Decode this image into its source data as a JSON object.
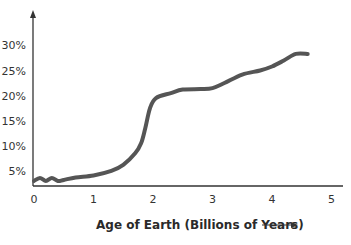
{
  "chart_data": {
    "type": "line",
    "title": "",
    "xlabel": "Age of Earth (Billions of Years)",
    "ylabel": "",
    "x_ticks": [
      "0",
      "1",
      "2",
      "3",
      "4",
      "5"
    ],
    "y_ticks": [
      "5%",
      "10%",
      "15%",
      "20%",
      "25%",
      "30%"
    ],
    "xlim": [
      0,
      5.2
    ],
    "ylim": [
      2.8,
      33
    ],
    "grid": false,
    "legend": null,
    "series": [
      {
        "name": "curve",
        "color": "#555555",
        "x": [
          0,
          0.1,
          0.2,
          0.3,
          0.4,
          0.5,
          0.7,
          1.0,
          1.3,
          1.5,
          1.7,
          1.8,
          1.87,
          1.95,
          2.05,
          2.3,
          2.5,
          2.8,
          3.0,
          3.2,
          3.5,
          3.8,
          4.0,
          4.2,
          4.4,
          4.6
        ],
        "y": [
          3.0,
          3.6,
          3.0,
          3.6,
          3.0,
          3.2,
          3.7,
          4.1,
          5.0,
          6.2,
          8.5,
          10.5,
          13.5,
          17.5,
          19.5,
          20.5,
          21.2,
          21.3,
          21.5,
          22.5,
          24.2,
          25.0,
          25.8,
          27.0,
          28.3,
          28.3
        ]
      }
    ]
  }
}
